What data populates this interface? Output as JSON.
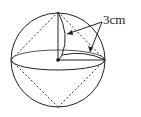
{
  "diagram": {
    "label": "3cm",
    "shape": "sphere with inscribed octahedron",
    "colors": {
      "stroke": "#222222",
      "background": "#ffffff"
    }
  }
}
